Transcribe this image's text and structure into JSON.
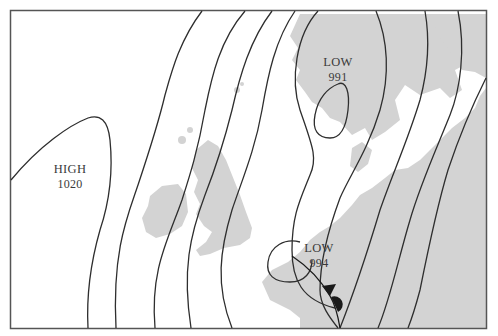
{
  "map": {
    "type": "synoptic weather chart",
    "colors": {
      "sea": "#ffffff",
      "land": "#d3d3d3",
      "isobar": "#2e2e2e",
      "frame": "#555555",
      "front": "#1a1a1a",
      "text": "#3a3a3a"
    },
    "pressure_systems": [
      {
        "kind": "HIGH",
        "value": "1020"
      },
      {
        "kind": "LOW",
        "value": "991"
      },
      {
        "kind": "LOW",
        "value": "994"
      }
    ],
    "fronts": [
      {
        "kind": "occluded-front-segment",
        "symbols": [
          "cold-front-triangle",
          "warm-front-semicircle"
        ]
      }
    ],
    "isobar_count": 10
  }
}
